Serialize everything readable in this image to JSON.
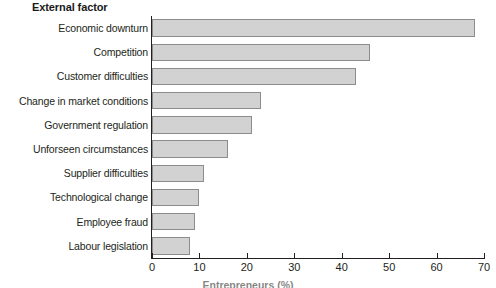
{
  "chart_data": {
    "type": "bar",
    "orientation": "horizontal",
    "title": "External factor",
    "xlabel": "Entrepreneurs (%)",
    "ylabel": "External factor",
    "xlim": [
      0,
      70
    ],
    "xticks": [
      0,
      10,
      20,
      30,
      40,
      50,
      60,
      70
    ],
    "grid": false,
    "legend": false,
    "categories": [
      "Economic downturn",
      "Competition",
      "Customer difficulties",
      "Change in market conditions",
      "Government regulation",
      "Unforseen circumstances",
      "Supplier difficulties",
      "Technological change",
      "Employee fraud",
      "Labour legislation"
    ],
    "values": [
      68,
      46,
      43,
      23,
      21,
      16,
      11,
      10,
      9,
      8
    ],
    "bar_fill": "#d2d2d2",
    "bar_border": "#8c8c8c",
    "axis_color": "#231f20"
  },
  "axis": {
    "tick_labels": [
      "0",
      "10",
      "20",
      "30",
      "40",
      "50",
      "60",
      "70"
    ],
    "title": "Entrepreneurs (%)"
  }
}
